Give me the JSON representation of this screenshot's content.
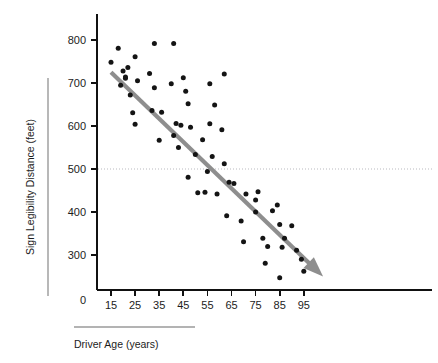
{
  "chart_data": {
    "type": "scatter",
    "title": "",
    "xlabel": "Driver Age (years)",
    "ylabel": "Sign Legibility Distance (feet)",
    "xlim": [
      10,
      105
    ],
    "ylim": [
      230,
      830
    ],
    "xticks": [
      15,
      25,
      35,
      45,
      55,
      65,
      75,
      85,
      95
    ],
    "yticks": [
      300,
      400,
      500,
      600,
      700,
      800
    ],
    "y_origin_label": "0",
    "grid": false,
    "legend": null,
    "reference_lines": [
      {
        "name": "legibility-500ft-reference",
        "orientation": "horizontal",
        "value": 500,
        "style": "dotted",
        "color": "#b9b9bf"
      }
    ],
    "annotations": [
      {
        "name": "trend-arrow",
        "type": "arrow",
        "from": [
          15,
          725
        ],
        "to": [
          103,
          250
        ],
        "color": "#8e8e8e",
        "description": "negative linear trend arrow"
      }
    ],
    "trend": {
      "x_start": 15,
      "y_start": 725,
      "x_end": 103,
      "y_end": 250,
      "slope": -5.4,
      "color": "#8e8e8e"
    },
    "series": [
      {
        "name": "Drivers",
        "marker": "filled-circle",
        "color": "#141414",
        "points": [
          [
            15,
            748
          ],
          [
            18,
            781
          ],
          [
            19,
            695
          ],
          [
            20,
            728
          ],
          [
            21,
            711
          ],
          [
            21,
            714
          ],
          [
            22,
            736
          ],
          [
            23,
            672
          ],
          [
            24,
            631
          ],
          [
            25,
            604
          ],
          [
            25,
            761
          ],
          [
            26,
            705
          ],
          [
            31,
            722
          ],
          [
            32,
            636
          ],
          [
            33,
            792
          ],
          [
            33,
            689
          ],
          [
            35,
            567
          ],
          [
            36,
            632
          ],
          [
            40,
            698
          ],
          [
            41,
            578
          ],
          [
            41,
            792
          ],
          [
            42,
            606
          ],
          [
            43,
            550
          ],
          [
            44,
            602
          ],
          [
            45,
            712
          ],
          [
            46,
            681
          ],
          [
            47,
            481
          ],
          [
            47,
            652
          ],
          [
            48,
            597
          ],
          [
            50,
            534
          ],
          [
            51,
            445
          ],
          [
            53,
            568
          ],
          [
            54,
            446
          ],
          [
            55,
            494
          ],
          [
            56,
            698
          ],
          [
            56,
            605
          ],
          [
            57,
            529
          ],
          [
            58,
            649
          ],
          [
            59,
            442
          ],
          [
            61,
            591
          ],
          [
            62,
            512
          ],
          [
            62,
            721
          ],
          [
            63,
            391
          ],
          [
            64,
            469
          ],
          [
            66,
            466
          ],
          [
            69,
            379
          ],
          [
            70,
            331
          ],
          [
            71,
            442
          ],
          [
            75,
            400
          ],
          [
            75,
            428
          ],
          [
            76,
            447
          ],
          [
            78,
            339
          ],
          [
            79,
            281
          ],
          [
            80,
            320
          ],
          [
            82,
            403
          ],
          [
            84,
            416
          ],
          [
            85,
            371
          ],
          [
            85,
            247
          ],
          [
            86,
            318
          ],
          [
            87,
            339
          ],
          [
            90,
            368
          ],
          [
            92,
            311
          ],
          [
            94,
            290
          ],
          [
            95,
            262
          ]
        ]
      }
    ]
  },
  "axis": {
    "x_tick_labels": [
      "15",
      "25",
      "35",
      "45",
      "55",
      "65",
      "75",
      "85",
      "95"
    ],
    "y_tick_labels": [
      "800",
      "700",
      "600",
      "500",
      "400",
      "300"
    ],
    "origin_label": "0"
  },
  "labels": {
    "x_axis_title": "Driver Age (years)",
    "y_axis_title": "Sign Legibility Distance (feet)"
  },
  "colors": {
    "background": "#ffffff",
    "axis": "#111111",
    "marker": "#141414",
    "trend": "#8e8e8e",
    "reference": "#b9b9bf",
    "title_rule": "#9a9a9a"
  }
}
